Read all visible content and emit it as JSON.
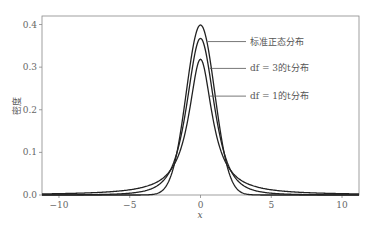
{
  "chart_data": {
    "type": "line",
    "title": "",
    "xlabel": "x",
    "ylabel": "密度",
    "xlim": [
      -11.2,
      11.2
    ],
    "ylim": [
      0.0,
      0.42
    ],
    "grid": false,
    "legend_position": "inline annotations, upper right of peak",
    "x_ticks": [
      -10,
      -5,
      0,
      5,
      10
    ],
    "x_tick_labels": [
      "−10",
      "−5",
      "0",
      "5",
      "10"
    ],
    "y_ticks": [
      0.0,
      0.1,
      0.2,
      0.3,
      0.4
    ],
    "y_tick_labels": [
      "0.0",
      "0.1",
      "0.2",
      "0.3",
      "0.4"
    ],
    "series": [
      {
        "name": "标准正态分布",
        "distribution": "normal",
        "df": null,
        "peak": 0.399
      },
      {
        "name": "df = 3的t分布",
        "distribution": "t",
        "df": 3,
        "peak": 0.368
      },
      {
        "name": "df = 1的t分布",
        "distribution": "t",
        "df": 1,
        "peak": 0.318
      }
    ],
    "annotations": [
      {
        "text": "标准正态分布",
        "y_label": 0.36
      },
      {
        "text": "df = 3的t分布",
        "y_label": 0.297
      },
      {
        "text": "df = 1的t分布",
        "y_label": 0.232
      }
    ]
  },
  "labels": {
    "ylabel": "密度",
    "xlabel": "x",
    "ann_normal": "标准正态分布",
    "ann_t3": "df = 3的t分布",
    "ann_t1": "df = 1的t分布"
  },
  "colors": {
    "line": "#222222",
    "axis": "#777777",
    "text": "#555555"
  }
}
